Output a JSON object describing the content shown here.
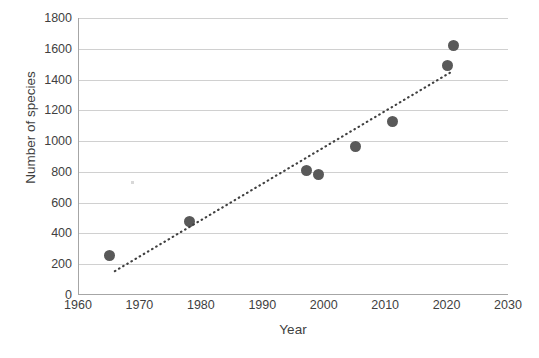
{
  "chart_data": {
    "type": "scatter",
    "title": "",
    "xlabel": "Year",
    "ylabel": "Number of species",
    "xlim": [
      1960,
      2030
    ],
    "ylim": [
      0,
      1800
    ],
    "xticks": [
      1960,
      1970,
      1980,
      1990,
      2000,
      2010,
      2020,
      2030
    ],
    "xtick_labels": [
      "1960",
      "1970",
      "1980",
      "1990",
      "2000",
      "2010",
      "2020",
      "2030"
    ],
    "yticks": [
      0,
      200,
      400,
      600,
      800,
      1000,
      1200,
      1400,
      1600,
      1800
    ],
    "ytick_labels": [
      "0",
      "200",
      "400",
      "600",
      "800",
      "1000",
      "1200",
      "1400",
      "1600",
      "1800"
    ],
    "grid": "horizontal",
    "legend": "none",
    "marker_color": "#595959",
    "gridline_color": "#d0d0d0",
    "axis_color": "#a6a6a6",
    "points": [
      {
        "x": 1965,
        "y": 255
      },
      {
        "x": 1978,
        "y": 480
      },
      {
        "x": 1997,
        "y": 810
      },
      {
        "x": 1999,
        "y": 785
      },
      {
        "x": 2005,
        "y": 965
      },
      {
        "x": 2011,
        "y": 1130
      },
      {
        "x": 2020,
        "y": 1490
      },
      {
        "x": 2021,
        "y": 1620
      }
    ],
    "series": [
      {
        "name": "Number of species",
        "x": [
          1965,
          1978,
          1997,
          1999,
          2005,
          2011,
          2020,
          2021
        ],
        "values": [
          255,
          480,
          810,
          785,
          965,
          1130,
          1490,
          1620
        ]
      }
    ],
    "trendline": {
      "style": "dotted",
      "color": "#404040",
      "x_start": 1966,
      "y_start": 155,
      "x_end": 2021,
      "y_end": 1455
    }
  },
  "footer": {
    "caption": ""
  }
}
